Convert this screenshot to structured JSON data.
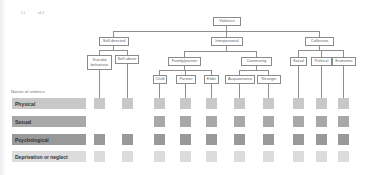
{
  "corner_marks": [
    "2 1",
    "a4 4"
  ],
  "tree": {
    "root": "Violence",
    "level1": [
      "Self-directed",
      "Interpersonal",
      "Collective"
    ],
    "self_directed": [
      "Suicidal behaviour",
      "Self-abuse"
    ],
    "interpersonal": [
      "Family/partner",
      "Community"
    ],
    "family_partner": [
      "Child",
      "Partner",
      "Elder"
    ],
    "community": [
      "Acquaintance",
      "Stranger"
    ],
    "collective": [
      "Social",
      "Political",
      "Economic"
    ]
  },
  "matrix": {
    "header": "Nature of violence",
    "columns": [
      "Suicidal behaviour",
      "Self-abuse",
      "Child",
      "Partner",
      "Elder",
      "Acquaintance",
      "Stranger",
      "Social",
      "Political",
      "Economic"
    ],
    "rows": [
      {
        "label": "Physical",
        "color": "#c8c8c8",
        "cells": [
          true,
          true,
          true,
          true,
          true,
          true,
          true,
          true,
          true,
          true
        ]
      },
      {
        "label": "Sexual",
        "color": "#a8a8a8",
        "cells": [
          false,
          false,
          true,
          true,
          true,
          true,
          true,
          true,
          true,
          true
        ]
      },
      {
        "label": "Psychological",
        "color": "#999999",
        "cells": [
          true,
          true,
          true,
          true,
          true,
          true,
          true,
          true,
          true,
          true
        ]
      },
      {
        "label": "Deprivation or neglect",
        "color": "#dcdcdc",
        "cells": [
          true,
          true,
          true,
          true,
          true,
          true,
          true,
          true,
          true,
          true
        ]
      }
    ]
  }
}
